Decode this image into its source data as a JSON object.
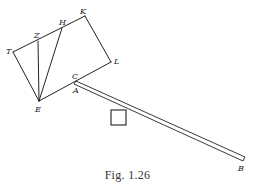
{
  "figure": {
    "caption": "Fig. 1.26",
    "stroke_color": "#222222",
    "points": {
      "T": {
        "label": "T",
        "x": 13,
        "y": 52
      },
      "Z": {
        "label": "Z",
        "x": 38,
        "y": 41
      },
      "H": {
        "label": "H",
        "x": 62,
        "y": 28
      },
      "K": {
        "label": "K",
        "x": 85,
        "y": 16
      },
      "L": {
        "label": "L",
        "x": 111,
        "y": 62
      },
      "C": {
        "label": "C",
        "x": 76,
        "y": 81
      },
      "A": {
        "label": "A",
        "x": 76,
        "y": 84
      },
      "E": {
        "label": "E",
        "x": 39,
        "y": 101
      },
      "B": {
        "label": "B",
        "x": 244,
        "y": 159
      }
    },
    "labels": {
      "T": "T",
      "Z": "Z",
      "H": "H",
      "K": "K",
      "L": "L",
      "C": "C",
      "A": "A",
      "E": "E",
      "B": "B"
    },
    "weight_box": {
      "x": 111,
      "y": 110,
      "size": 15
    }
  }
}
